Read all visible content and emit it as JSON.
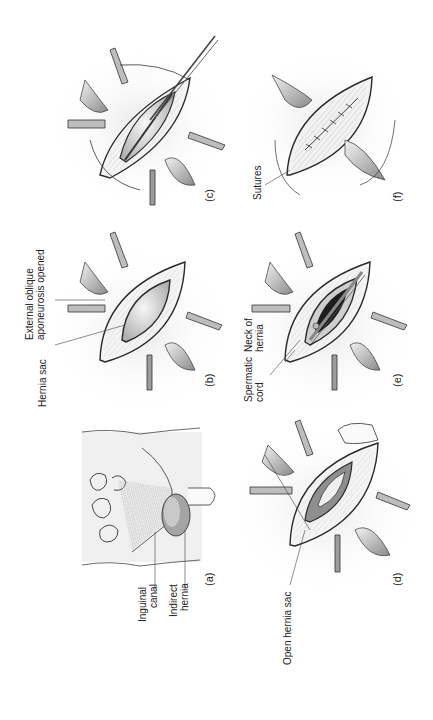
{
  "figure": {
    "orientation": "rotated-90-ccw",
    "panels": [
      {
        "id": "a",
        "caption": "(a)",
        "labels": [
          "Inguinal canal",
          "Indirect hernia"
        ]
      },
      {
        "id": "b",
        "caption": "(b)",
        "labels": [
          "Hernia sac",
          "External oblique aponeurosis opened"
        ]
      },
      {
        "id": "c",
        "caption": "(c)",
        "labels": []
      },
      {
        "id": "d",
        "caption": "(d)",
        "labels": [
          "Open hernia sac"
        ]
      },
      {
        "id": "e",
        "caption": "(e)",
        "labels": [
          "Spermatic cord",
          "Neck of hernia"
        ]
      },
      {
        "id": "f",
        "caption": "(f)",
        "labels": [
          "Sutures"
        ]
      }
    ]
  },
  "labels": {
    "a_inguinal_1": "Inguinal",
    "a_inguinal_2": "canal",
    "a_indirect_1": "Indirect",
    "a_indirect_2": "hernia",
    "b_sac": "Hernia sac",
    "b_ext_1": "External oblique",
    "b_ext_2": "aponeurosis opened",
    "d_open": "Open hernia sac",
    "e_cord_1": "Spermatic",
    "e_cord_2": "cord",
    "e_neck_1": "Neck of",
    "e_neck_2": "hernia",
    "f_sutures": "Sutures"
  },
  "captions": {
    "a": "(a)",
    "b": "(b)",
    "c": "(c)",
    "d": "(d)",
    "e": "(e)",
    "f": "(f)"
  },
  "colors": {
    "line": "#2a2a2a",
    "tissue_dark": "#8c8c8c",
    "tissue_mid": "#bdbdbd",
    "tissue_light": "#e6e6e6",
    "background": "#ffffff"
  }
}
